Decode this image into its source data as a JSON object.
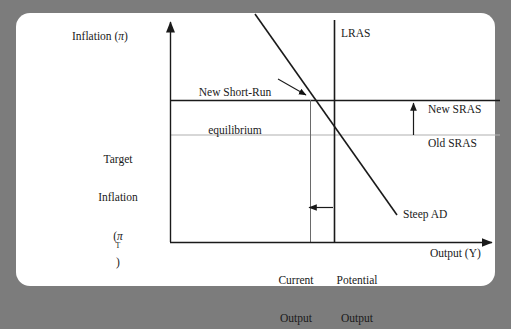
{
  "figure": {
    "type": "economics-diagram",
    "background_color": "#7c7c7c",
    "card_color": "#ffffff",
    "axes": {
      "y_label": "Inflation (π)",
      "x_label": "Output (Y)"
    },
    "labels": {
      "lras": "LRAS",
      "new_sras": "New SRAS",
      "old_sras": "Old SRAS",
      "steep_ad": "Steep AD",
      "equilibrium_line1": "New Short-Run",
      "equilibrium_line2": "equilibrium",
      "target_line1": "Target",
      "target_line2": "Inflation",
      "target_line3_pre": "(π",
      "target_line3_sup": "T",
      "target_line3_post": ")",
      "current_output_line1": "Current",
      "current_output_line2": "Output",
      "potential_output_line1": "Potential",
      "potential_output_line2": "Output"
    },
    "colors": {
      "new_sras_line": "#1a1a1a",
      "old_sras_line": "#b0b0b0",
      "lras_line": "#1a1a1a",
      "current_output_line": "#555555",
      "ad_line": "#1a1a1a",
      "axis": "#1a1a1a",
      "text": "#1a1a1a"
    }
  },
  "chart_data": {
    "type": "line",
    "title": "",
    "xlabel": "Output (Y)",
    "ylabel": "Inflation (π)",
    "grid": false,
    "legend": "inline-annotations",
    "axis_origin_px": [
      170,
      242
    ],
    "series": [
      {
        "name": "New SRAS",
        "kind": "horizontal-line",
        "y_px": 100,
        "x_from_px": 170,
        "x_to_px": 500,
        "color": "#1a1a1a",
        "width": 1.6,
        "note": "Shifted upward from Old SRAS"
      },
      {
        "name": "Old SRAS",
        "kind": "horizontal-line",
        "y_px": 135,
        "x_from_px": 170,
        "x_to_px": 500,
        "color": "#b0b0b0",
        "width": 1.2,
        "note": "At target inflation level"
      },
      {
        "name": "LRAS",
        "kind": "vertical-line",
        "x_px": 334,
        "y_from_px": 20,
        "y_to_px": 242,
        "color": "#1a1a1a",
        "width": 1.6,
        "note": "Potential output"
      },
      {
        "name": "Current Output",
        "kind": "vertical-line",
        "x_px": 310,
        "y_from_px": 100,
        "y_to_px": 242,
        "color": "#555555",
        "width": 1.0
      },
      {
        "name": "Steep AD",
        "kind": "segment",
        "from_px": [
          255,
          14
        ],
        "to_px": [
          397,
          215
        ],
        "color": "#1a1a1a",
        "width": 1.6
      }
    ],
    "annotations": [
      {
        "text": "New Short-Run equilibrium",
        "points_to_px": [
          311,
          100
        ],
        "arrow_from_px": [
          282,
          82
        ]
      },
      {
        "text": "Target Inflation (π^T)",
        "points_to_px": [
          170,
          135
        ]
      },
      {
        "text": "upward shift of SRAS",
        "kind": "arrow-up",
        "x_px": 413,
        "y_from_px": 135,
        "y_to_px": 100
      },
      {
        "text": "contraction of output",
        "kind": "arrow-left",
        "y_px": 207,
        "x_from_px": 333,
        "x_to_px": 307
      }
    ],
    "axis_ticks": {
      "x": [
        "Current Output",
        "Potential Output"
      ],
      "y": [
        "Target Inflation (π^T)"
      ]
    }
  }
}
